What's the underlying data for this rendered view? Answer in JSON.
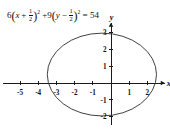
{
  "equation": {
    "coef_x": "6",
    "open_paren": "(",
    "var_x": "x",
    "op_x": "+",
    "frac_x_num": "1",
    "frac_x_den": "2",
    "close_paren": ")",
    "exp_x": "2",
    "plus": "+",
    "coef_y": "9",
    "var_y": "y",
    "op_y": "−",
    "frac_y_num": "1",
    "frac_y_den": "2",
    "exp_y": "2",
    "equals": "=",
    "rhs": "54",
    "full_text": "6(x + 1/2)² + 9(y − 1/2)² = 54"
  },
  "axes": {
    "x_label": "x",
    "y_label": "y",
    "x_ticks": [
      {
        "value": -5,
        "label": "-5"
      },
      {
        "value": -4,
        "label": "-4"
      },
      {
        "value": -3,
        "label": "-3"
      },
      {
        "value": -2,
        "label": "-2"
      },
      {
        "value": -1,
        "label": "-1"
      },
      {
        "value": 1,
        "label": "1"
      },
      {
        "value": 2,
        "label": "2"
      }
    ],
    "y_ticks": [
      {
        "value": 3,
        "label": "3"
      },
      {
        "value": 2,
        "label": "2"
      },
      {
        "value": 1,
        "label": "1"
      },
      {
        "value": -1,
        "label": "-1"
      },
      {
        "value": -2,
        "label": "-2"
      }
    ]
  },
  "chart_data": {
    "type": "line",
    "xlabel": "x",
    "ylabel": "y",
    "xlim": [
      -5.9,
      2.9
    ],
    "ylim": [
      -2.4,
      3.5
    ],
    "grid": false,
    "legend": "none",
    "curve": {
      "shape": "ellipse",
      "center": [
        -0.5,
        0.5
      ],
      "semi_axis_x": 3.0,
      "semi_axis_y": 2.449,
      "x_intercept_range": [
        -3.5,
        2.5
      ],
      "y_intercept_range": [
        -1.949,
        2.949
      ],
      "stroke": "#2b2b2b",
      "fill": "none"
    }
  },
  "colors": {
    "axis": "#1a1a1a",
    "curve": "#2b2b2b",
    "text": "#111111",
    "background": "#ffffff"
  }
}
